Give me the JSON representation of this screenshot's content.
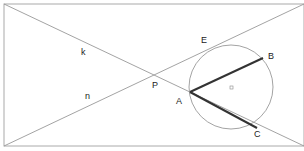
{
  "diagram": {
    "type": "geometry",
    "labels": {
      "k": "k",
      "n": "n",
      "P": "P",
      "E": "E",
      "B": "B",
      "A": "A",
      "C": "C",
      "O": "o"
    },
    "colors": {
      "thin_line": "#999999",
      "thick_line": "#333333",
      "text": "#222222"
    }
  }
}
